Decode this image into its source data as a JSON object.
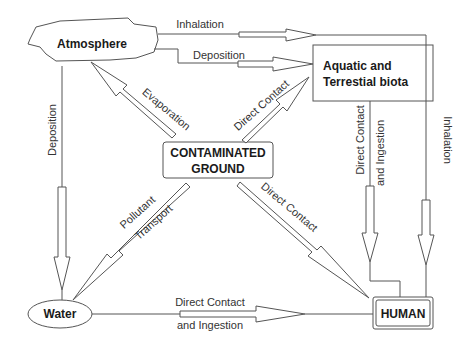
{
  "nodes": {
    "atmosphere": "Atmosphere",
    "biota_line1": "Aquatic and",
    "biota_line2": "Terrestial biota",
    "ground_line1": "CONTAMINATED",
    "ground_line2": "GROUND",
    "water": "Water",
    "human": "HUMAN"
  },
  "edges": {
    "atm_inhalation": "Inhalation",
    "atm_deposition_biota": "Deposition",
    "atm_deposition_water": "Deposition",
    "evaporation": "Evaporation",
    "ground_biota": "Direct Contact",
    "ground_human": "Direct Contact",
    "pollutant_line1": "Pollutant",
    "pollutant_line2": "Transport",
    "biota_human_line1": "Direct Contact",
    "biota_human_line2": "and Ingestion",
    "inhalation_right": "Inhalation",
    "water_human_line1": "Direct Contact",
    "water_human_line2": "and Ingestion"
  }
}
